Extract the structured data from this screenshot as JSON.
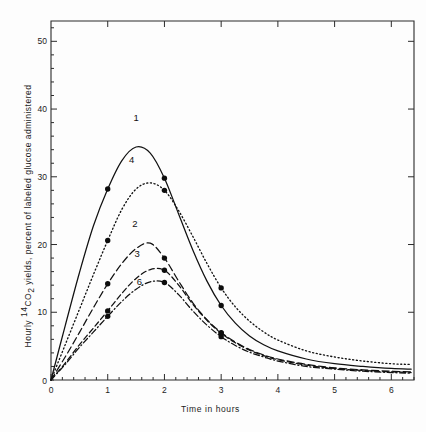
{
  "chart_data": {
    "type": "line",
    "title": "",
    "xlabel": "Time in hours",
    "ylabel": "Hourly 14CO2 yields, percent of labeled glucose administered",
    "ylabel_prefix": "Hourly ",
    "ylabel_sup": "14",
    "ylabel_co": "CO",
    "ylabel_sub": "2",
    "ylabel_suffix": " yields, percent of labeled glucose administered",
    "xlim": [
      0,
      6.4
    ],
    "ylim": [
      0,
      53
    ],
    "xticks": [
      0,
      1,
      2,
      3,
      4,
      5,
      6
    ],
    "xtick_labels": [
      "0",
      "1",
      "2",
      "3",
      "4",
      "5",
      "6"
    ],
    "yticks": [
      10,
      20,
      30,
      40,
      50
    ],
    "ytick_labels": [
      "10",
      "20",
      "30",
      "40",
      "50"
    ],
    "xminor_step": 0.2,
    "grid": false,
    "legend_position": "inline-curve-labels",
    "frame": "box",
    "series": [
      {
        "name": "1",
        "label": "1",
        "style": "solid",
        "label_x": 1.5,
        "label_y": 38.2,
        "x": [
          0,
          0.25,
          0.5,
          0.75,
          1.0,
          1.25,
          1.5,
          1.75,
          2.0,
          2.25,
          2.5,
          2.75,
          3.0,
          3.25,
          3.5,
          3.75,
          4.0,
          4.5,
          5.0,
          5.5,
          6.0,
          6.35
        ],
        "y": [
          0,
          8.0,
          15.8,
          22.8,
          28.2,
          32.4,
          34.4,
          33.5,
          29.8,
          24.5,
          19.2,
          14.6,
          11.0,
          8.4,
          6.5,
          5.2,
          4.3,
          3.1,
          2.4,
          2.0,
          1.7,
          1.6
        ],
        "markers_x": [
          1.0,
          2.0,
          3.0
        ],
        "markers_y": [
          28.2,
          29.8,
          11.0
        ]
      },
      {
        "name": "4",
        "label": "4",
        "style": "dotted",
        "label_x": 1.42,
        "label_y": 32.0,
        "x": [
          0,
          0.25,
          0.5,
          0.75,
          1.0,
          1.25,
          1.5,
          1.75,
          2.0,
          2.25,
          2.5,
          2.75,
          3.0,
          3.25,
          3.5,
          3.75,
          4.0,
          4.5,
          5.0,
          5.5,
          6.0,
          6.35
        ],
        "y": [
          0,
          5.2,
          10.4,
          15.6,
          20.6,
          25.2,
          28.2,
          29.1,
          28.0,
          25.0,
          21.2,
          17.2,
          13.6,
          10.8,
          8.7,
          7.1,
          5.9,
          4.3,
          3.4,
          2.8,
          2.4,
          2.3
        ],
        "markers_x": [
          1.0,
          2.0,
          3.0
        ],
        "markers_y": [
          20.6,
          28.0,
          13.6
        ]
      },
      {
        "name": "2",
        "label": "2",
        "style": "dashed",
        "label_x": 1.48,
        "label_y": 22.6,
        "x": [
          0,
          0.25,
          0.5,
          0.75,
          1.0,
          1.25,
          1.5,
          1.75,
          2.0,
          2.25,
          2.5,
          2.75,
          3.0,
          3.25,
          3.5,
          3.75,
          4.0,
          4.5,
          5.0,
          5.5,
          6.0,
          6.35
        ],
        "y": [
          0,
          3.4,
          7.0,
          10.7,
          14.2,
          17.2,
          19.4,
          20.2,
          18.0,
          14.6,
          11.4,
          8.9,
          7.0,
          5.6,
          4.5,
          3.7,
          3.1,
          2.3,
          1.8,
          1.5,
          1.3,
          1.2
        ],
        "markers_x": [
          1.0,
          2.0,
          3.0
        ],
        "markers_y": [
          14.2,
          18.0,
          7.0
        ]
      },
      {
        "name": "3",
        "label": "3",
        "style": "dashed2",
        "label_x": 1.52,
        "label_y": 18.2,
        "x": [
          0,
          0.25,
          0.5,
          0.75,
          1.0,
          1.25,
          1.5,
          1.75,
          2.0,
          2.25,
          2.5,
          2.75,
          3.0,
          3.25,
          3.5,
          3.75,
          4.0,
          4.5,
          5.0,
          5.5,
          6.0,
          6.35
        ],
        "y": [
          0,
          2.5,
          5.2,
          7.7,
          10.2,
          12.8,
          15.0,
          16.3,
          16.2,
          14.0,
          11.2,
          8.8,
          6.9,
          5.5,
          4.4,
          3.6,
          3.0,
          2.2,
          1.7,
          1.4,
          1.2,
          1.1
        ],
        "markers_x": [
          1.0,
          2.0,
          3.0
        ],
        "markers_y": [
          10.2,
          16.2,
          6.9
        ]
      },
      {
        "name": "6",
        "label": "6",
        "style": "dashdot",
        "label_x": 1.56,
        "label_y": 14.0,
        "x": [
          0,
          0.25,
          0.5,
          0.75,
          1.0,
          1.25,
          1.5,
          1.75,
          2.0,
          2.25,
          2.5,
          2.75,
          3.0,
          3.25,
          3.5,
          3.75,
          4.0,
          4.5,
          5.0,
          5.5,
          6.0,
          6.35
        ],
        "y": [
          0,
          2.3,
          4.8,
          7.1,
          9.4,
          11.6,
          13.4,
          14.5,
          14.4,
          12.6,
          10.2,
          8.1,
          6.4,
          5.1,
          4.1,
          3.4,
          2.8,
          2.0,
          1.6,
          1.3,
          1.1,
          1.0
        ],
        "markers_x": [
          1.0,
          2.0,
          3.0
        ],
        "markers_y": [
          9.4,
          14.4,
          6.4
        ]
      }
    ]
  }
}
